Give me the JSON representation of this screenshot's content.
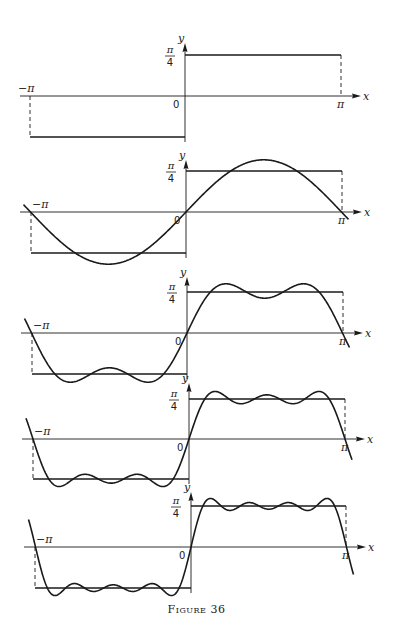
{
  "caption": "Figure 36",
  "labels": {
    "x_axis": "x",
    "y_axis": "y",
    "origin": "0",
    "left_limit": "−π",
    "right_limit": "π",
    "level_numerator": "π",
    "level_denominator": "4"
  },
  "chart_data": [
    {
      "type": "line",
      "title": "Square wave f(x) = −π/4 on (−π,0), π/4 on (0,π)",
      "series": [
        {
          "name": "f(x)",
          "kind": "square_wave",
          "terms": 0
        }
      ],
      "xlim": [
        "-π",
        "π"
      ],
      "ylim": [
        "-π/4",
        "π/4"
      ],
      "xlabel": "x",
      "ylabel": "y",
      "tick_labels": [
        "−π",
        "0",
        "π",
        "π/4"
      ],
      "grid": false
    },
    {
      "type": "line",
      "title": "Partial sum: sin x",
      "series": [
        {
          "name": "square wave",
          "kind": "square_wave"
        },
        {
          "name": "S1",
          "kind": "fourier_partial_sum",
          "terms": 1,
          "formula": "sin x"
        }
      ],
      "xlim": [
        "-π",
        "π"
      ],
      "xlabel": "x",
      "ylabel": "y",
      "tick_labels": [
        "−π",
        "0",
        "π",
        "π/4"
      ],
      "grid": false
    },
    {
      "type": "line",
      "title": "Partial sum: sin x + sin 3x/3",
      "series": [
        {
          "name": "square wave",
          "kind": "square_wave"
        },
        {
          "name": "S2",
          "kind": "fourier_partial_sum",
          "terms": 2,
          "formula": "sin x + sin3x/3"
        }
      ],
      "xlim": [
        "-π",
        "π"
      ],
      "xlabel": "x",
      "ylabel": "y",
      "tick_labels": [
        "−π",
        "0",
        "π",
        "π/4"
      ],
      "grid": false
    },
    {
      "type": "line",
      "title": "Partial sum: sin x + sin 3x/3 + sin 5x/5",
      "series": [
        {
          "name": "square wave",
          "kind": "square_wave"
        },
        {
          "name": "S3",
          "kind": "fourier_partial_sum",
          "terms": 3,
          "formula": "sin x + sin3x/3 + sin5x/5"
        }
      ],
      "xlim": [
        "-π",
        "π"
      ],
      "xlabel": "x",
      "ylabel": "y",
      "tick_labels": [
        "−π",
        "0",
        "π",
        "π/4"
      ],
      "grid": false
    },
    {
      "type": "line",
      "title": "Partial sum: sin x + sin 3x/3 + sin 5x/5 + sin 7x/7",
      "series": [
        {
          "name": "square wave",
          "kind": "square_wave"
        },
        {
          "name": "S4",
          "kind": "fourier_partial_sum",
          "terms": 4,
          "formula": "sin x + sin3x/3 + sin5x/5 + sin7x/7"
        }
      ],
      "xlim": [
        "-π",
        "π"
      ],
      "xlabel": "x",
      "ylabel": "y",
      "tick_labels": [
        "−π",
        "0",
        "π",
        "π/4"
      ],
      "grid": false
    }
  ],
  "panels_layout": [
    {
      "axis_y": 96,
      "cx": 185,
      "left": 30,
      "right": 341,
      "level": 41,
      "arrow_top": 43,
      "axis_start": 20
    },
    {
      "axis_y": 212,
      "cx": 186,
      "left": 31,
      "right": 342,
      "level": 41,
      "arrow_top": 160,
      "axis_start": 20
    },
    {
      "axis_y": 333,
      "cx": 187,
      "left": 32,
      "right": 343,
      "level": 41,
      "arrow_top": 277,
      "axis_start": 21
    },
    {
      "axis_y": 439,
      "cx": 189,
      "left": 33,
      "right": 345,
      "level": 40,
      "arrow_top": 383,
      "axis_start": 22
    },
    {
      "axis_y": 547,
      "cx": 191,
      "left": 35,
      "right": 346,
      "level": 41,
      "arrow_top": 492,
      "axis_start": 24
    }
  ]
}
